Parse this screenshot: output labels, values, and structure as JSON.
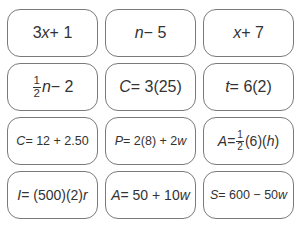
{
  "cards": [
    {
      "id": "c1",
      "text": "3x + 1"
    },
    {
      "id": "c2",
      "text": "n − 5"
    },
    {
      "id": "c3",
      "text": "x + 7"
    },
    {
      "id": "c4",
      "text": "1/2 n − 2"
    },
    {
      "id": "c5",
      "text": "C = 3(25)"
    },
    {
      "id": "c6",
      "text": "t = 6(2)"
    },
    {
      "id": "c7",
      "text": "C = 12 + 2.50"
    },
    {
      "id": "c8",
      "text": "P = 2(8) + 2w"
    },
    {
      "id": "c9",
      "text": "A = 1/2(6)(h)"
    },
    {
      "id": "c10",
      "text": "I = (500)(2)r"
    },
    {
      "id": "c11",
      "text": "A = 50 + 10w"
    },
    {
      "id": "c12",
      "text": "S = 600 − 50w"
    }
  ],
  "parts": {
    "c1": {
      "a": "3",
      "v": "x",
      "b": " + 1"
    },
    "c2": {
      "v": "n",
      "b": " − 5"
    },
    "c3": {
      "v": "x",
      "b": " + 7"
    },
    "c4": {
      "num": "1",
      "den": "2",
      "v": "n",
      "b": " − 2"
    },
    "c5": {
      "v": "C",
      "b": " = 3(25)"
    },
    "c6": {
      "v": "t",
      "b": " = 6(2)"
    },
    "c7": {
      "v": "C",
      "b": " = 12 + 2.50"
    },
    "c8": {
      "v": "P",
      "b": " = 2(8) + 2",
      "w": "w"
    },
    "c9": {
      "v": "A",
      "b": " = ",
      "num": "1",
      "den": "2",
      "c": "(6)(",
      "h": "h",
      "d": ")"
    },
    "c10": {
      "v": "I",
      "b": " = (500)(2)",
      "r": "r"
    },
    "c11": {
      "v": "A",
      "b": " = 50 + 10",
      "w": "w"
    },
    "c12": {
      "v": "S",
      "b": " = 600 − 50",
      "w": "w"
    }
  },
  "footer": {
    "text": "· · · · · · · · · · · · · · · · · · · ·"
  }
}
